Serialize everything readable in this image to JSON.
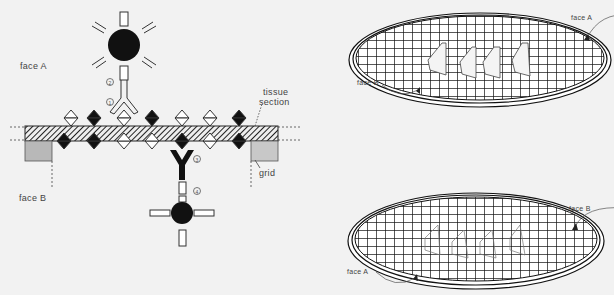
{
  "left_panel": {
    "face_a_label": "face A",
    "face_b_label": "face B",
    "tissue_label_line1": "tissue",
    "tissue_label_line2": "section",
    "grid_label": "grid",
    "step_markers": [
      "1",
      "2",
      "3",
      "4"
    ]
  },
  "right_top": {
    "face_a_label": "face A",
    "face_b_label": "face B",
    "sections_visible": 4
  },
  "right_bottom": {
    "face_a_label": "face A",
    "face_b_label": "face B"
  },
  "colors": {
    "background": "#f2f2f2",
    "ink": "#1a1a1a",
    "grid_bar": "#b8b8b8",
    "section_fill": "#ffffff"
  }
}
